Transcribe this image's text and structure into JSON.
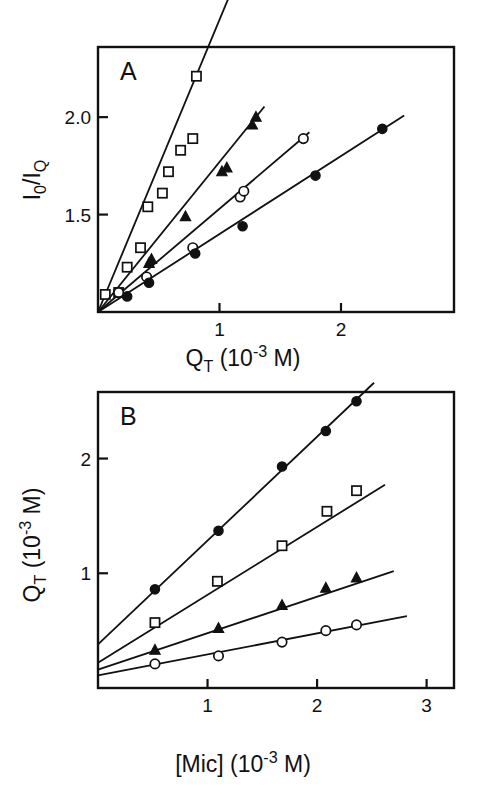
{
  "figure": {
    "background": "#ffffff",
    "ink": "#111111",
    "panels": [
      "A",
      "B"
    ]
  },
  "chart_data": [
    {
      "type": "scatter",
      "panel_label": "A",
      "title": "",
      "xlabel": "Q_T (10^-3 M)",
      "xlabel_parts": {
        "base": "Q",
        "sub": "T",
        "paren_open": "(10",
        "sup": "-3",
        "unit": " M)"
      },
      "ylabel": "I_0 / I_Q",
      "ylabel_parts": {
        "num_base": "I",
        "num_sub": "0",
        "slash": "/",
        "den_base": "I",
        "den_sub": "Q"
      },
      "xlim": [
        0,
        2.93
      ],
      "ylim": [
        1.0,
        2.36
      ],
      "xticks": [
        1,
        2
      ],
      "xticklabels": [
        "1",
        "2"
      ],
      "yticks": [
        1.5,
        2.0
      ],
      "yticklabels": [
        "1.5",
        "2.0"
      ],
      "grid": false,
      "legend": "none",
      "series": [
        {
          "name": "open-square",
          "marker": "open-square",
          "slope": 1.5,
          "intercept": 1.0,
          "line_x": [
            0.0,
            1.07
          ],
          "points_x": [
            0.06,
            0.17,
            0.24,
            0.35,
            0.41,
            0.53,
            0.58,
            0.68,
            0.78,
            0.81
          ],
          "points_y": [
            1.09,
            1.1,
            1.23,
            1.33,
            1.54,
            1.61,
            1.72,
            1.83,
            1.89,
            2.21
          ]
        },
        {
          "name": "filled-triangle",
          "marker": "filled-triangle",
          "slope": 0.77,
          "intercept": 1.0,
          "line_x": [
            0.0,
            1.37
          ],
          "points_x": [
            0.42,
            0.44,
            0.72,
            1.02,
            1.06,
            1.27,
            1.3
          ],
          "points_y": [
            1.25,
            1.27,
            1.49,
            1.72,
            1.74,
            1.96,
            2.0
          ]
        },
        {
          "name": "open-circle",
          "marker": "open-circle",
          "slope": 0.53,
          "intercept": 1.0,
          "line_x": [
            0.0,
            1.74
          ],
          "points_x": [
            0.17,
            0.4,
            0.78,
            1.17,
            1.2,
            1.69
          ],
          "points_y": [
            1.1,
            1.18,
            1.33,
            1.59,
            1.62,
            1.89
          ]
        },
        {
          "name": "filled-circle",
          "marker": "filled-circle",
          "slope": 0.4,
          "intercept": 1.0,
          "line_x": [
            0.0,
            2.52
          ],
          "points_x": [
            0.24,
            0.42,
            0.8,
            1.19,
            1.79,
            2.34
          ],
          "points_y": [
            1.08,
            1.15,
            1.3,
            1.44,
            1.7,
            1.94
          ]
        }
      ]
    },
    {
      "type": "scatter",
      "panel_label": "B",
      "title": "",
      "xlabel": "[Mic] (10^-3 M)",
      "xlabel_parts": {
        "base": "[Mic]",
        "paren_open": "(10",
        "sup": "-3",
        "unit": " M)"
      },
      "ylabel": "Q_T (10^-3 M)",
      "ylabel_parts": {
        "base": "Q",
        "sub": "T",
        "paren_open": "(10",
        "sup": "-3",
        "unit": " M)"
      },
      "xlim": [
        0,
        3.25
      ],
      "ylim": [
        0,
        2.58
      ],
      "xticks": [
        1,
        2,
        3
      ],
      "xticklabels": [
        "1",
        "2",
        "3"
      ],
      "yticks": [
        1,
        2
      ],
      "yticklabels": [
        "1",
        "2"
      ],
      "grid": false,
      "legend": "none",
      "series": [
        {
          "name": "filled-circle",
          "marker": "filled-circle",
          "slope": 0.905,
          "intercept": 0.38,
          "line_x": [
            0.0,
            2.52
          ],
          "points_x": [
            0.52,
            1.1,
            1.68,
            2.08,
            2.36
          ],
          "points_y": [
            0.86,
            1.37,
            1.93,
            2.24,
            2.5
          ]
        },
        {
          "name": "open-square",
          "marker": "open-square",
          "slope": 0.592,
          "intercept": 0.22,
          "line_x": [
            0.0,
            2.62
          ],
          "points_x": [
            0.52,
            1.09,
            1.68,
            2.09,
            2.36
          ],
          "points_y": [
            0.57,
            0.93,
            1.24,
            1.54,
            1.72
          ]
        },
        {
          "name": "filled-triangle",
          "marker": "filled-triangle",
          "slope": 0.318,
          "intercept": 0.16,
          "line_x": [
            0.0,
            2.7
          ],
          "points_x": [
            0.52,
            1.1,
            1.68,
            2.08,
            2.36
          ],
          "points_y": [
            0.33,
            0.52,
            0.72,
            0.87,
            0.96
          ]
        },
        {
          "name": "open-circle",
          "marker": "open-circle",
          "slope": 0.183,
          "intercept": 0.11,
          "line_x": [
            0.0,
            2.82
          ],
          "points_x": [
            0.52,
            1.1,
            1.68,
            2.08,
            2.36
          ],
          "points_y": [
            0.21,
            0.28,
            0.4,
            0.5,
            0.55
          ]
        }
      ]
    }
  ]
}
